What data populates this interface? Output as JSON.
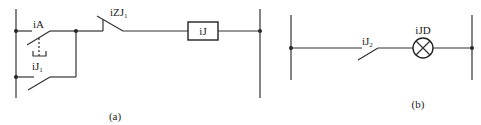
{
  "diagram_a": {
    "caption": "(a)",
    "contacts": {
      "iA": {
        "label": "iA"
      },
      "iJ1": {
        "label": "iJ",
        "subscript": "1"
      },
      "iZJ1": {
        "label": "iZJ",
        "subscript": "1"
      }
    },
    "coil": {
      "label": "iJ"
    }
  },
  "diagram_b": {
    "caption": "(b)",
    "contact": {
      "label": "iJ",
      "subscript": "2"
    },
    "lamp": {
      "label": "iJD"
    }
  },
  "colors": {
    "line": "#333333",
    "background": "#ffffff"
  }
}
